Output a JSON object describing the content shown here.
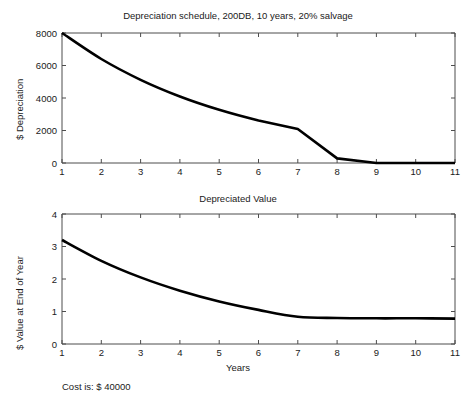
{
  "figure": {
    "background": "#ffffff",
    "line_color": "#000000",
    "axis_color": "#4d4d4d",
    "footnote": "Cost is: $ 40000"
  },
  "chart_data": [
    {
      "id": "depreciation-schedule",
      "type": "line",
      "title": "Depreciation schedule, 200DB, 10 years, 20% salvage",
      "xlabel": "",
      "ylabel": "$ Depreciation",
      "xlim": [
        1,
        11
      ],
      "ylim": [
        0,
        8000
      ],
      "xticks": [
        1,
        2,
        3,
        4,
        5,
        6,
        7,
        8,
        9,
        10,
        11
      ],
      "xticklabels": [
        "1",
        "2",
        "3",
        "4",
        "5",
        "6",
        "7",
        "8",
        "9",
        "10",
        "11"
      ],
      "yticks": [
        0,
        2000,
        4000,
        6000,
        8000
      ],
      "yticklabels": [
        "0",
        "2000",
        "4000",
        "6000",
        "8000"
      ],
      "grid": false,
      "legend": null,
      "x": [
        1,
        2,
        3,
        4,
        5,
        6,
        7,
        8,
        9,
        10,
        11
      ],
      "values": [
        8000,
        6400,
        5120,
        4096,
        3277,
        2621,
        2097,
        286,
        0,
        0,
        0
      ]
    },
    {
      "id": "depreciated-value",
      "type": "line",
      "title": "Depreciated Value",
      "xlabel": "Years",
      "ylabel": "$ Value at End of Year",
      "xlim": [
        1,
        11
      ],
      "ylim": [
        0,
        4
      ],
      "xticks": [
        1,
        2,
        3,
        4,
        5,
        6,
        7,
        8,
        9,
        10,
        11
      ],
      "xticklabels": [
        "1",
        "2",
        "3",
        "4",
        "5",
        "6",
        "7",
        "8",
        "9",
        "10",
        "11"
      ],
      "yticks": [
        0,
        1,
        2,
        3,
        4
      ],
      "yticklabels": [
        "0",
        "1",
        "2",
        "3",
        "4"
      ],
      "grid": false,
      "legend": null,
      "x": [
        1,
        2,
        3,
        4,
        5,
        6,
        7,
        8,
        9,
        10,
        11
      ],
      "values": [
        3.2,
        2.56,
        2.05,
        1.64,
        1.31,
        1.05,
        0.84,
        0.8,
        0.79,
        0.79,
        0.78
      ],
      "value_scale_note": "x10^4"
    }
  ]
}
